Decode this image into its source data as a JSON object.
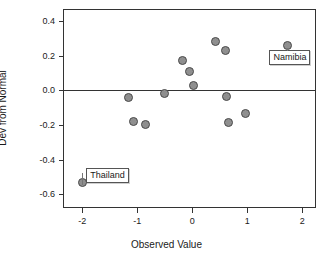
{
  "chart_data": {
    "type": "scatter",
    "title": "",
    "xlabel": "Observed Value",
    "ylabel": "Dev from Normal",
    "xlim": [
      -2.35,
      2.25
    ],
    "ylim": [
      -0.68,
      0.47
    ],
    "xticks": [
      -2,
      -1,
      0,
      1,
      2
    ],
    "xtick_labels": [
      "-2",
      "-1",
      "0",
      "1",
      "2"
    ],
    "yticks": [
      0.4,
      0.2,
      0.0,
      -0.2,
      -0.4,
      -0.6
    ],
    "ytick_labels": [
      "0.4",
      "0.2",
      "0.0",
      "-0.2",
      "-0.4",
      "-0.6"
    ],
    "grid": false,
    "legend": "none",
    "reference_line": {
      "axis": "y",
      "value": 0.0
    },
    "marker": {
      "shape": "circle",
      "fill": "#8f8f8f",
      "edge": "#4a4a4a",
      "size_px": 9
    },
    "points": [
      {
        "x": -2.0,
        "y": -0.53,
        "label": "Thailand"
      },
      {
        "x": -1.16,
        "y": -0.04,
        "label": ""
      },
      {
        "x": -1.06,
        "y": -0.18,
        "label": ""
      },
      {
        "x": -0.85,
        "y": -0.2,
        "label": ""
      },
      {
        "x": -0.5,
        "y": -0.02,
        "label": ""
      },
      {
        "x": -0.17,
        "y": 0.17,
        "label": ""
      },
      {
        "x": -0.05,
        "y": 0.11,
        "label": ""
      },
      {
        "x": 0.03,
        "y": 0.03,
        "label": ""
      },
      {
        "x": 0.43,
        "y": 0.28,
        "label": ""
      },
      {
        "x": 0.6,
        "y": 0.23,
        "label": ""
      },
      {
        "x": 0.62,
        "y": -0.035,
        "label": ""
      },
      {
        "x": 0.66,
        "y": -0.185,
        "label": ""
      },
      {
        "x": 0.97,
        "y": -0.135,
        "label": ""
      },
      {
        "x": 1.73,
        "y": 0.26,
        "label": "Namibia"
      }
    ],
    "annotations": [
      {
        "text": "Thailand",
        "for_point": {
          "x": -2.0,
          "y": -0.53
        }
      },
      {
        "text": "Namibia",
        "for_point": {
          "x": 1.73,
          "y": 0.26
        }
      }
    ]
  },
  "colors": {
    "axis": "#333333",
    "marker_fill": "#8f8f8f",
    "marker_edge": "#4a4a4a",
    "background": "#ffffff",
    "label_border": "#555555"
  }
}
